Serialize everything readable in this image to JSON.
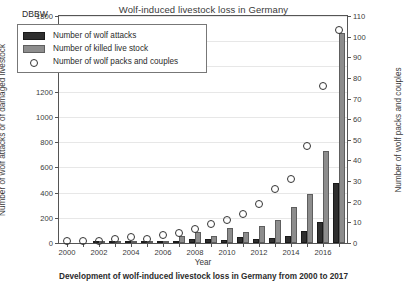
{
  "figure": {
    "title": "Wolf-induced livestock loss in Germany",
    "caption": "Development of wolf-induced livestock loss in Germany from 2000 to 2017",
    "source_label": "DBBW"
  },
  "legend": {
    "header": "DBBW",
    "entries": [
      {
        "marker": "dark-bar-swatch",
        "label": "Number of wolf attacks"
      },
      {
        "marker": "gray-bar-swatch",
        "label": "Number of killed live stock"
      },
      {
        "marker": "open-circle-marker",
        "label": "Number of wolf packs and couples"
      }
    ]
  },
  "axes": {
    "x_title": "Year",
    "y_left_title": "Number of wolf attacks or of damaged livestock",
    "y_right_title": "Number of wolf packs and couples",
    "y_left_ticks": [
      0,
      200,
      400,
      600,
      800,
      1000,
      1200,
      1400,
      1600,
      1800
    ],
    "y_right_ticks": [
      0,
      10,
      20,
      30,
      40,
      50,
      60,
      70,
      80,
      90,
      100,
      110
    ],
    "x_ticks": [
      2000,
      2002,
      2004,
      2006,
      2008,
      2010,
      2012,
      2014,
      2016
    ]
  },
  "colors": {
    "attacks_bar": "#2f2f2f",
    "killed_bar": "#8d8d8d",
    "packs_marker": "#333333",
    "grid": "#e7e7e7",
    "frame": "#555555",
    "text": "#2b2b2b",
    "background": "#ffffff"
  },
  "chart_data": {
    "type": "bar",
    "title": "Wolf-induced livestock loss in Germany",
    "xlabel": "Year",
    "ylabel": "Number of wolf attacks or of damaged livestock",
    "y2label": "Number of wolf packs and couples",
    "ylim": [
      0,
      1800
    ],
    "y2lim": [
      0,
      110
    ],
    "grid": true,
    "legend_position": "upper-left",
    "categories": [
      2000,
      2001,
      2002,
      2003,
      2004,
      2005,
      2006,
      2007,
      2008,
      2009,
      2010,
      2011,
      2012,
      2013,
      2014,
      2015,
      2016,
      2017
    ],
    "series": [
      {
        "name": "Number of wolf attacks",
        "axis": "left",
        "type": "bar",
        "values": [
          0,
          0,
          4,
          4,
          8,
          3,
          7,
          17,
          32,
          29,
          24,
          44,
          32,
          38,
          54,
          95,
          170,
          472
        ]
      },
      {
        "name": "Number of killed live stock",
        "axis": "left",
        "type": "bar",
        "values": [
          0,
          0,
          9,
          11,
          18,
          6,
          15,
          57,
          89,
          54,
          121,
          88,
          135,
          185,
          284,
          387,
          733,
          1667
        ]
      },
      {
        "name": "Number of wolf packs and couples",
        "axis": "right",
        "type": "scatter",
        "values": [
          1,
          1,
          1,
          2,
          3,
          2,
          4,
          5,
          7,
          9,
          11,
          14,
          19,
          26,
          31,
          47,
          76,
          103
        ]
      }
    ]
  }
}
